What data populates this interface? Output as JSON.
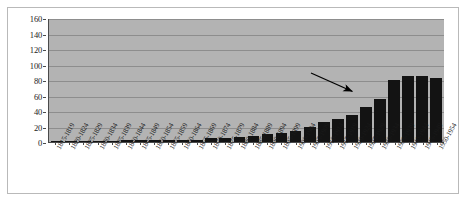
{
  "chart_data": {
    "type": "bar",
    "title": "",
    "xlabel": "",
    "ylabel": "",
    "ylim": [
      0,
      160
    ],
    "ytick_step": 20,
    "yticks": [
      0,
      20,
      40,
      60,
      80,
      100,
      120,
      140,
      160
    ],
    "grid": true,
    "legend": false,
    "bar_color": "#131313",
    "plot_background": "#b3b3b3",
    "gridline_color": "#8d8d8d",
    "axis_color": "#4a4a4a",
    "categories": [
      "1815-1819",
      "1820-1824",
      "1825-1829",
      "1830-1834",
      "1835-1839",
      "1840-1844",
      "1845-1849",
      "1850-1854",
      "1855-1859",
      "1860-1864",
      "1865-1869",
      "1870-1874",
      "1875-1879",
      "1880-1884",
      "1885-1889",
      "1890-1894",
      "1895-1899",
      "1900-1904",
      "1905-1909",
      "1910-1914",
      "1915-1919",
      "1920-1924",
      "1925-1929",
      "1930-1934",
      "1935-1939",
      "1940-1944",
      "1945-1949",
      "1950-1954"
    ],
    "values": [
      1,
      1,
      1,
      1,
      1,
      2,
      2,
      2,
      2,
      3,
      3,
      5,
      5,
      7,
      8,
      10,
      12,
      14,
      19,
      26,
      30,
      35,
      45,
      55,
      80,
      85,
      85,
      83
    ],
    "annotations": [
      {
        "name": "arrow-annotation",
        "text": "",
        "points_to_category": "1925-1929",
        "color": "#000000"
      }
    ]
  }
}
